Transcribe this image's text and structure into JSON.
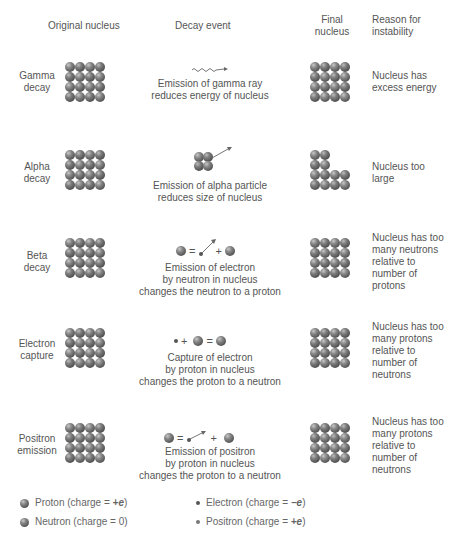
{
  "headers": {
    "original": "Original nucleus",
    "event": "Decay event",
    "final_line1": "Final",
    "final_line2": "nucleus",
    "reason_line1": "Reason for",
    "reason_line2": "instability"
  },
  "rows": [
    {
      "label": [
        "Gamma",
        "decay"
      ],
      "description": [
        "Emission of gamma ray",
        "reduces energy of nucleus"
      ],
      "reason": [
        "Nucleus has",
        "excess energy"
      ],
      "event_icon": "wavy-gamma-ray-arrow",
      "final_shape": "full-4x4"
    },
    {
      "label": [
        "Alpha",
        "decay"
      ],
      "description": [
        "Emission of alpha particle",
        "reduces size of nucleus"
      ],
      "reason": [
        "Nucleus too",
        "large"
      ],
      "event_icon": "alpha-particle-2x2-with-arrow",
      "final_shape": "L-shape-12"
    },
    {
      "label": [
        "Beta",
        "decay"
      ],
      "equation": [
        "neutron",
        "=",
        "electron-arrow",
        "+",
        "proton"
      ],
      "description": [
        "Emission of electron",
        "by neutron in nucleus",
        "changes the neutron to a proton"
      ],
      "reason": [
        "Nucleus has too",
        "many neutrons",
        "relative to",
        "number of",
        "protons"
      ],
      "final_shape": "full-4x4"
    },
    {
      "label": [
        "Electron",
        "capture"
      ],
      "equation": [
        "electron",
        "+",
        "proton",
        "=",
        "neutron"
      ],
      "description": [
        "Capture of electron",
        "by proton in nucleus",
        "changes the proton to a neutron"
      ],
      "reason": [
        "Nucleus has too",
        "many protons",
        "relative to",
        "number of",
        "neutrons"
      ],
      "final_shape": "full-4x4"
    },
    {
      "label": [
        "Positron",
        "emission"
      ],
      "equation": [
        "proton",
        "=",
        "positron-arrow",
        "+",
        "neutron"
      ],
      "description": [
        "Emission of positron",
        "by proton in nucleus",
        "changes the proton to a neutron"
      ],
      "reason": [
        "Nucleus has too",
        "many protons",
        "relative to",
        "number of",
        "neutrons"
      ],
      "final_shape": "full-4x4"
    }
  ],
  "equation_symbols": {
    "equals": "=",
    "plus": "+"
  },
  "legend": {
    "proton": {
      "name": "Proton (charge = ",
      "charge": "+e",
      "close": ")"
    },
    "neutron": {
      "name": "Neutron (charge = 0)"
    },
    "electron": {
      "name": "Electron (charge = ",
      "charge": "−e",
      "close": ")"
    },
    "positron": {
      "name": "Positron (charge = ",
      "charge": "+e",
      "close": ")"
    }
  },
  "colors": {
    "text": "#555555",
    "sphere_dark": "#3e3e3e",
    "sphere_light": "#c8c8c8",
    "background": "#ffffff"
  }
}
